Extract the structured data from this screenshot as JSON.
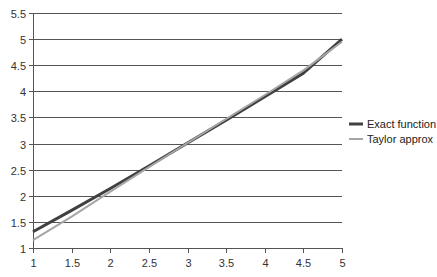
{
  "chart_data": {
    "type": "line",
    "title": "",
    "xlabel": "",
    "ylabel": "",
    "x": [
      1,
      1.5,
      2,
      2.5,
      3,
      3.5,
      4,
      4.5,
      5
    ],
    "xlim": [
      1,
      5
    ],
    "ylim": [
      1,
      5.5
    ],
    "x_ticks": [
      "1",
      "1.5",
      "2",
      "2.5",
      "3",
      "3.5",
      "4",
      "4.5",
      "5"
    ],
    "y_ticks": [
      "1",
      "1.5",
      "2",
      "2.5",
      "3",
      "3.5",
      "4",
      "4.5",
      "5",
      "5.5"
    ],
    "grid": "horizontal",
    "legend_position": "right",
    "series": [
      {
        "name": "Exact function",
        "color": "#404040",
        "values": [
          1.31,
          1.72,
          2.14,
          2.57,
          3.01,
          3.45,
          3.9,
          4.35,
          5.0
        ]
      },
      {
        "name": "Taylor approx",
        "color": "#a6a6a6",
        "values": [
          1.15,
          1.6,
          2.08,
          2.55,
          3.01,
          3.47,
          3.93,
          4.4,
          4.95
        ]
      }
    ]
  },
  "legend": {
    "items": [
      {
        "label": "Exact function",
        "color": "#404040"
      },
      {
        "label": "Taylor approx",
        "color": "#a6a6a6"
      }
    ]
  }
}
